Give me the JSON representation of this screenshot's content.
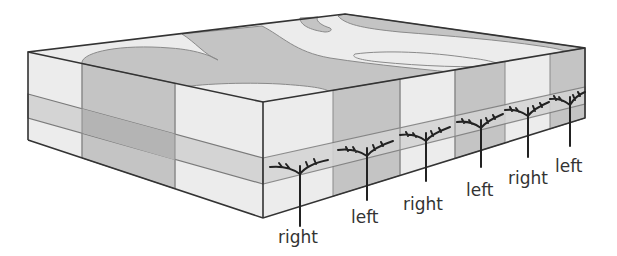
{
  "diagram": {
    "type": "block-diagram",
    "colors": {
      "light": "#ececec",
      "gray": "#c4c4c4",
      "stripe_light": "#d4d4d4",
      "stripe_dark": "#b4b4b4",
      "outline": "#333333",
      "root": "#222222",
      "text": "#333333"
    },
    "labels": [
      {
        "id": "label-1",
        "text": "right",
        "x": 300,
        "y": 243
      },
      {
        "id": "label-2",
        "text": "left",
        "x": 366,
        "y": 223
      },
      {
        "id": "label-3",
        "text": "right",
        "x": 425,
        "y": 210
      },
      {
        "id": "label-4",
        "text": "left",
        "x": 482,
        "y": 196
      },
      {
        "id": "label-5",
        "text": "right",
        "x": 530,
        "y": 184
      },
      {
        "id": "label-6",
        "text": "left",
        "x": 571,
        "y": 172
      }
    ]
  }
}
